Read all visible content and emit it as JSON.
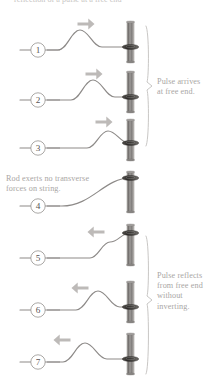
{
  "figure": {
    "title_cut": "reflection of a pulse at a free end",
    "background": "#ffffff",
    "width": 219,
    "height": 383,
    "line_color": "#8d8a88",
    "rod_color_dark": "#6e6b69",
    "rod_color_light": "#c9c6c4",
    "ring_color": "#3b3937",
    "arrow_color": "#b9b6b4",
    "text_color": "#a9a6a4",
    "brace_color": "#c2bfbd",
    "circle_stroke": "#9b9896",
    "circle_text": "#585553"
  },
  "annotations": {
    "brace_top_label": "Pulse arrives\nat free end.",
    "brace_bottom_label": "Pulse reflects\nfrom free end\nwithout\ninverting.",
    "rod_note": "Rod exerts no transverse\nforces on string."
  },
  "panels": [
    {
      "number": "1",
      "label_x": 38,
      "label_y": 50,
      "leader_to_x": 58,
      "arrow": "right",
      "arrow_x": 86,
      "arrow_y": 24,
      "pulse_center": 80,
      "pulse_height": 20,
      "pulse_width": 44,
      "baseline_y": 50,
      "ring_y": 47,
      "rod_top": 22,
      "rod_bottom": 62,
      "string_end_y": 47,
      "string_end_offset": 0
    },
    {
      "number": "2",
      "label_x": 38,
      "label_y": 100,
      "leader_to_x": 58,
      "arrow": "right",
      "arrow_x": 94,
      "arrow_y": 74,
      "pulse_center": 93,
      "pulse_height": 20,
      "pulse_width": 44,
      "baseline_y": 100,
      "ring_y": 97,
      "rod_top": 72,
      "rod_bottom": 112,
      "string_end_y": 97,
      "string_end_offset": 0
    },
    {
      "number": "3",
      "label_x": 38,
      "label_y": 148,
      "leader_to_x": 58,
      "arrow": "right",
      "arrow_x": 104,
      "arrow_y": 122,
      "pulse_center": 108,
      "pulse_height": 17,
      "pulse_width": 42,
      "baseline_y": 148,
      "ring_y": 143,
      "rod_top": 120,
      "rod_bottom": 160,
      "string_end_y": 143,
      "string_end_offset": 0
    },
    {
      "number": "4",
      "label_x": 38,
      "label_y": 206,
      "leader_to_x": 58,
      "arrow": "none",
      "arrow_x": 0,
      "arrow_y": 0,
      "pulse_center": 0,
      "pulse_height": 0,
      "pulse_width": 0,
      "baseline_y": 206,
      "ring_y": 178,
      "rod_top": 172,
      "rod_bottom": 212,
      "string_end_y": 178,
      "string_end_offset": 0
    },
    {
      "number": "5",
      "label_x": 38,
      "label_y": 258,
      "leader_to_x": 58,
      "arrow": "left",
      "arrow_x": 96,
      "arrow_y": 232,
      "pulse_center": 110,
      "pulse_height": 16,
      "pulse_width": 40,
      "baseline_y": 258,
      "ring_y": 233,
      "rod_top": 225,
      "rod_bottom": 265,
      "string_end_y": 233,
      "string_end_offset": 0
    },
    {
      "number": "6",
      "label_x": 38,
      "label_y": 310,
      "leader_to_x": 58,
      "arrow": "left",
      "arrow_x": 80,
      "arrow_y": 288,
      "pulse_center": 98,
      "pulse_height": 19,
      "pulse_width": 44,
      "baseline_y": 310,
      "ring_y": 307,
      "rod_top": 282,
      "rod_bottom": 322,
      "string_end_y": 307,
      "string_end_offset": 0
    },
    {
      "number": "7",
      "label_x": 38,
      "label_y": 362,
      "leader_to_x": 58,
      "arrow": "left",
      "arrow_x": 62,
      "arrow_y": 340,
      "pulse_center": 85,
      "pulse_height": 19,
      "pulse_width": 44,
      "baseline_y": 362,
      "ring_y": 359,
      "rod_top": 334,
      "rod_bottom": 374,
      "string_end_y": 359,
      "string_end_offset": 0
    }
  ],
  "rod": {
    "x": 127,
    "width": 7
  },
  "braces": {
    "top": {
      "x": 146,
      "y1": 26,
      "y2": 146,
      "tip_y": 86
    },
    "bottom": {
      "x": 146,
      "y1": 236,
      "y2": 374,
      "tip_y": 300
    }
  }
}
